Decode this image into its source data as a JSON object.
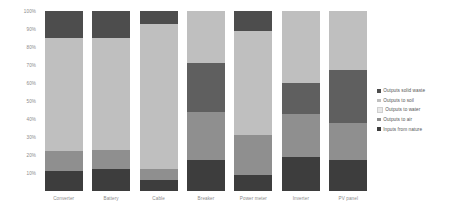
{
  "chart_data": {
    "type": "bar",
    "stacked": true,
    "stack_mode": "percent",
    "title": "",
    "subtitle": "",
    "xlabel": "",
    "ylabel": "",
    "ylim": [
      0,
      100
    ],
    "ytick_labels": [
      "100%",
      "90%",
      "80%",
      "70%",
      "60%",
      "50%",
      "40%",
      "30%",
      "20%",
      "10%"
    ],
    "ytick_values": [
      100,
      90,
      80,
      70,
      60,
      50,
      40,
      30,
      20,
      10
    ],
    "grid": false,
    "legend_position": "right",
    "categories": [
      "Converter",
      "Battery",
      "Cable",
      "Breaker",
      "Power meter",
      "Inverter",
      "PV panel"
    ],
    "series": [
      {
        "name": "Outputs solid waste",
        "color": "#4d4d4d",
        "values": [
          15,
          15,
          7,
          0,
          11,
          0,
          0
        ]
      },
      {
        "name": "Outputs to soil",
        "color": "#bfbfbf",
        "values": [
          63,
          62,
          81,
          29,
          58,
          40,
          33
        ]
      },
      {
        "name": "Outputs to water",
        "color": "#5f5f5f",
        "values": [
          0,
          0,
          0,
          27,
          0,
          17,
          29
        ]
      },
      {
        "name": "Outputs to air",
        "color": "#8f8f8f",
        "values": [
          11,
          11,
          6,
          27,
          22,
          24,
          21
        ]
      },
      {
        "name": "Inputs from nature",
        "color": "#3d3d3d",
        "values": [
          11,
          12,
          6,
          17,
          9,
          19,
          17
        ]
      }
    ]
  },
  "legend": {
    "items": [
      {
        "label": "Outputs solid waste",
        "color": "#4d4d4d"
      },
      {
        "label": "Outputs to soil",
        "color": "#bfbfbf"
      },
      {
        "label": "Outputs to water",
        "color": "#e8e8e8"
      },
      {
        "label": "Outputs to air",
        "color": "#8f8f8f"
      },
      {
        "label": "Inputs from nature",
        "color": "#3d3d3d"
      }
    ]
  }
}
